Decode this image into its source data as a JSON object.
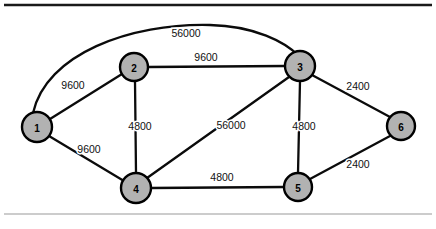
{
  "figure": {
    "kind": "network-topology-diagram",
    "background_color": "#ffffff",
    "node_fill_color": "#b2b2b2",
    "node_stroke_color": "#000000",
    "edge_color": "#0b0b0b",
    "top_rule_color": "#1a1a1a",
    "bottom_rule_color": "#9a9a9a"
  },
  "nodes": [
    {
      "id": "1",
      "label": "1",
      "cx": 37,
      "cy": 127,
      "r": 15
    },
    {
      "id": "2",
      "label": "2",
      "cx": 134,
      "cy": 67,
      "r": 14
    },
    {
      "id": "3",
      "label": "3",
      "cx": 300,
      "cy": 66,
      "r": 15
    },
    {
      "id": "4",
      "label": "4",
      "cx": 136,
      "cy": 188,
      "r": 15
    },
    {
      "id": "5",
      "label": "5",
      "cx": 298,
      "cy": 187,
      "r": 14
    },
    {
      "id": "6",
      "label": "6",
      "cx": 401,
      "cy": 126,
      "r": 14
    }
  ],
  "edges": [
    {
      "id": "e-1-3",
      "from": "1",
      "to": "3",
      "label": "56000",
      "label_x": 186,
      "label_y": 33,
      "shape": "curve"
    },
    {
      "id": "e-1-2",
      "from": "1",
      "to": "2",
      "label": "9600",
      "label_x": 73,
      "label_y": 85,
      "shape": "line"
    },
    {
      "id": "e-1-4",
      "from": "1",
      "to": "4",
      "label": "9600",
      "label_x": 89,
      "label_y": 149,
      "shape": "line"
    },
    {
      "id": "e-2-3",
      "from": "2",
      "to": "3",
      "label": "9600",
      "label_x": 206,
      "label_y": 57,
      "shape": "line"
    },
    {
      "id": "e-2-4",
      "from": "2",
      "to": "4",
      "label": "4800",
      "label_x": 140,
      "label_y": 126,
      "shape": "line"
    },
    {
      "id": "e-3-4",
      "from": "3",
      "to": "4",
      "label": "56000",
      "label_x": 231,
      "label_y": 125,
      "shape": "line"
    },
    {
      "id": "e-3-5",
      "from": "3",
      "to": "5",
      "label": "4800",
      "label_x": 304,
      "label_y": 126,
      "shape": "line"
    },
    {
      "id": "e-3-6",
      "from": "3",
      "to": "6",
      "label": "2400",
      "label_x": 358,
      "label_y": 86,
      "shape": "line"
    },
    {
      "id": "e-4-5",
      "from": "4",
      "to": "5",
      "label": "4800",
      "label_x": 222,
      "label_y": 177,
      "shape": "line"
    },
    {
      "id": "e-5-6",
      "from": "5",
      "to": "6",
      "label": "2400",
      "label_x": 358,
      "label_y": 164,
      "shape": "line"
    }
  ],
  "rules": [
    {
      "id": "top-rule",
      "x1": 4,
      "y1": 5,
      "x2": 432,
      "y2": 5,
      "width": 2.6
    },
    {
      "id": "bottom-rule",
      "x1": 4,
      "y1": 214,
      "x2": 432,
      "y2": 214,
      "width": 1.2
    }
  ]
}
